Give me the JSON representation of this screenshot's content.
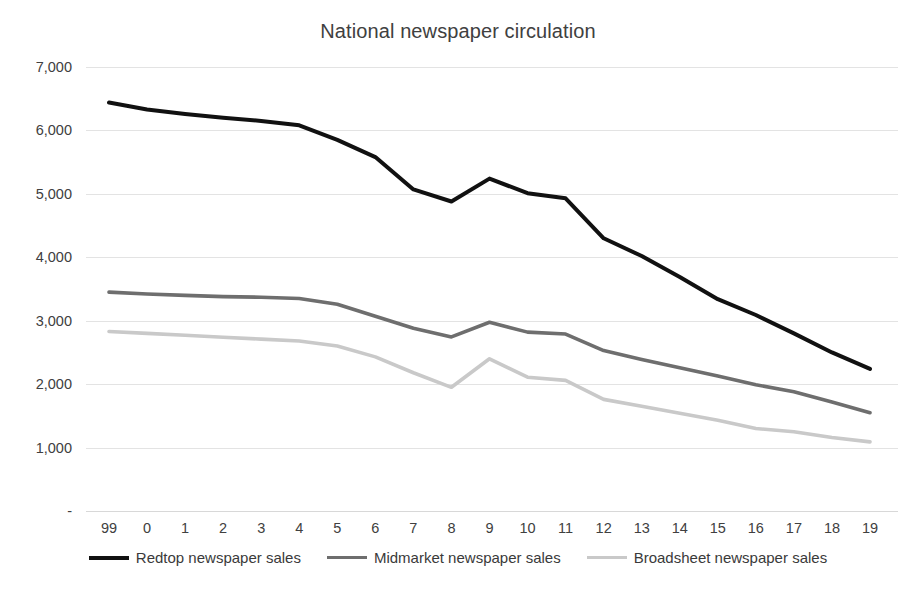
{
  "chart_data": {
    "type": "line",
    "title": "National newspaper circulation",
    "xlabel": "",
    "ylabel": "",
    "x": [
      "99",
      "0",
      "1",
      "2",
      "3",
      "4",
      "5",
      "6",
      "7",
      "8",
      "9",
      "10",
      "11",
      "12",
      "13",
      "14",
      "15",
      "16",
      "17",
      "18",
      "19"
    ],
    "categories": [
      "99",
      "0",
      "1",
      "2",
      "3",
      "4",
      "5",
      "6",
      "7",
      "8",
      "9",
      "10",
      "11",
      "12",
      "13",
      "14",
      "15",
      "16",
      "17",
      "18",
      "19"
    ],
    "ylim": [
      0,
      7000
    ],
    "ytick_values": [
      0,
      1000,
      2000,
      3000,
      4000,
      5000,
      6000,
      7000
    ],
    "ytick_labels": [
      "-",
      "1,000",
      "2,000",
      "3,000",
      "4,000",
      "5,000",
      "6,000",
      "7,000"
    ],
    "grid": true,
    "legend_position": "bottom",
    "series": [
      {
        "name": "Redtop newspaper sales",
        "color": "#111111",
        "width": 4.0,
        "values": [
          6440,
          6330,
          6260,
          6200,
          6150,
          6080,
          5850,
          5580,
          5070,
          4880,
          5240,
          5010,
          4930,
          4300,
          4020,
          3690,
          3340,
          3090,
          2800,
          2500,
          2240
        ]
      },
      {
        "name": "Midmarket newspaper sales",
        "color": "#6e6e6e",
        "width": 3.6,
        "values": [
          3450,
          3420,
          3400,
          3380,
          3370,
          3350,
          3260,
          3070,
          2880,
          2745,
          2975,
          2820,
          2790,
          2530,
          2390,
          2260,
          2130,
          1990,
          1880,
          1720,
          1550
        ]
      },
      {
        "name": "Broadsheet newspaper sales",
        "color": "#c9c9c9",
        "width": 3.6,
        "values": [
          2830,
          2800,
          2770,
          2740,
          2710,
          2680,
          2600,
          2430,
          2180,
          1950,
          2400,
          2110,
          2060,
          1760,
          1650,
          1540,
          1430,
          1300,
          1250,
          1160,
          1090
        ]
      }
    ]
  },
  "legend": {
    "items": [
      {
        "label": "Redtop newspaper sales",
        "color": "#111111"
      },
      {
        "label": "Midmarket newspaper sales",
        "color": "#6e6e6e"
      },
      {
        "label": "Broadsheet newspaper sales",
        "color": "#c9c9c9"
      }
    ]
  }
}
